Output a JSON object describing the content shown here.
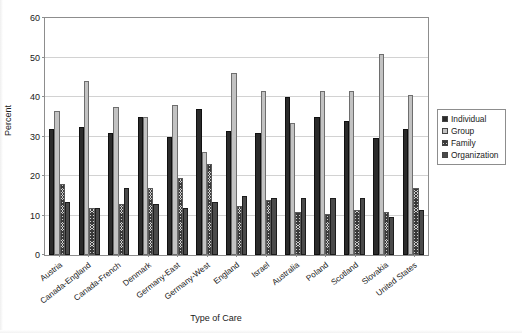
{
  "title_partial": "",
  "legend": {
    "position": "right",
    "items": [
      {
        "label": "Individual",
        "key": "individual"
      },
      {
        "label": "Group",
        "key": "group"
      },
      {
        "label": "Family",
        "key": "family"
      },
      {
        "label": "Organization",
        "key": "organization"
      }
    ]
  },
  "chart_data": {
    "type": "bar",
    "title": "",
    "xlabel": "Type of Care",
    "ylabel": "Percent",
    "ylim": [
      0,
      60
    ],
    "yticks": [
      0,
      10,
      20,
      30,
      40,
      50,
      60
    ],
    "grid": true,
    "legend_position": "right",
    "categories": [
      "Austria",
      "Canada-England",
      "Canada-French",
      "Denmark",
      "Germany-East",
      "Germany-West",
      "England",
      "Israel",
      "Australia",
      "Poland",
      "Scotland",
      "Slovakia",
      "United States"
    ],
    "series": [
      {
        "name": "Individual",
        "values": [
          32,
          32.5,
          31,
          35,
          30,
          37,
          31.5,
          31,
          40,
          35,
          34,
          29.5,
          32
        ]
      },
      {
        "name": "Group",
        "values": [
          36.5,
          44,
          37.5,
          35,
          38,
          26,
          46,
          41.5,
          33.5,
          41.5,
          41.5,
          51,
          40.5
        ]
      },
      {
        "name": "Family",
        "values": [
          18,
          12,
          13,
          17,
          19.5,
          23,
          12.5,
          14,
          11,
          10.5,
          11.5,
          11,
          17
        ]
      },
      {
        "name": "Organization",
        "values": [
          13.5,
          12,
          17,
          13,
          12,
          13.5,
          15,
          14.5,
          14.5,
          14.5,
          14.5,
          9.5,
          11.5
        ]
      }
    ]
  }
}
